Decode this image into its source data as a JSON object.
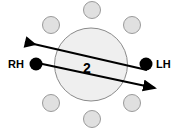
{
  "figure": {
    "background_color": "#ffffff",
    "width": 177,
    "height": 133
  },
  "main_disc": {
    "name": "central-disc",
    "center_x": 91,
    "center_y": 64.5,
    "radius": 36.5,
    "fill_color": "#efefef",
    "stroke_color": "#8a8a8a",
    "stroke_width": 1
  },
  "bolt_circles": {
    "fill_color": "#e0e0e0",
    "stroke_color": "#9a9a9a",
    "radius": 8.5,
    "items": [
      {
        "name": "bolt-top",
        "cx": 92,
        "cy": 10
      },
      {
        "name": "bolt-upper-left",
        "cx": 51,
        "cy": 25
      },
      {
        "name": "bolt-upper-right",
        "cx": 132,
        "cy": 25
      },
      {
        "name": "bolt-lower-left",
        "cx": 51,
        "cy": 103
      },
      {
        "name": "bolt-lower-right",
        "cx": 132,
        "cy": 103
      },
      {
        "name": "bolt-bottom",
        "cx": 92,
        "cy": 119
      }
    ]
  },
  "hand_points": {
    "fill_color": "#000000",
    "radius": 6.5,
    "left": {
      "name": "right-hand-point",
      "label": "RH",
      "cx": 36,
      "cy": 64,
      "label_x": 8,
      "label_y": 68
    },
    "right": {
      "name": "left-hand-point",
      "label": "LH",
      "cx": 146,
      "cy": 64,
      "label_x": 156,
      "label_y": 68
    }
  },
  "force_arrows": {
    "stroke_color": "#000000",
    "stroke_width": 2,
    "upper": {
      "name": "upper-force-arrow",
      "description": "arrow pointing up and to the left",
      "x1": 147,
      "y1": 70,
      "x2": 25,
      "y2": 42
    },
    "lower": {
      "name": "lower-force-arrow",
      "description": "arrow pointing down and to the right",
      "x1": 33,
      "y1": 62,
      "x2": 155,
      "y2": 88
    }
  },
  "dimension": {
    "name": "separation-dimension",
    "value": "2",
    "x": 87,
    "y": 73
  }
}
